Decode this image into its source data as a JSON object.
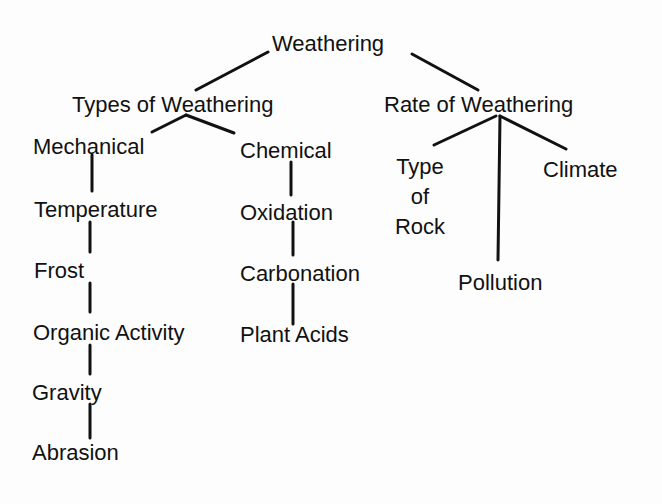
{
  "diagram": {
    "type": "concept-map",
    "root": "Weathering",
    "branches": {
      "types": {
        "label": "Types of Weathering",
        "mechanical": {
          "label": "Mechanical",
          "items": [
            "Temperature",
            "Frost",
            "Organic Activity",
            "Gravity",
            "Abrasion"
          ]
        },
        "chemical": {
          "label": "Chemical",
          "items": [
            "Oxidation",
            "Carbonation",
            "Plant Acids"
          ]
        }
      },
      "rate": {
        "label": "Rate of Weathering",
        "type_of_rock": {
          "line1": "Type",
          "line2": "of",
          "line3": "Rock"
        },
        "pollution": "Pollution",
        "climate": "Climate"
      }
    },
    "line_color": "#111111"
  }
}
